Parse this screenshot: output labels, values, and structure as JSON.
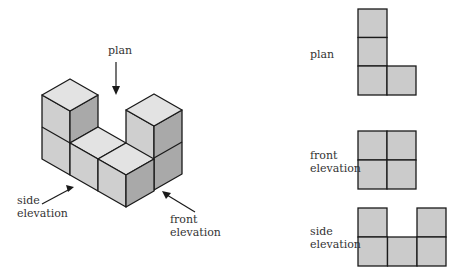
{
  "colors": {
    "top_face": "#e3e3e3",
    "left_face": "#cfcfcf",
    "right_face": "#a9a9a9",
    "square_fill": "#cbcbcb",
    "stroke": "#1a1a1a"
  },
  "isometric": {
    "labels": {
      "plan": "plan",
      "side_line1": "side",
      "side_line2": "elevation",
      "front_line1": "front",
      "front_line2": "elevation"
    }
  },
  "views": {
    "plan": {
      "label": "plan",
      "grid": "L-shape: 3 squares tall in left column, 1 square right at bottom"
    },
    "front": {
      "label_line1": "front",
      "label_line2": "elevation",
      "grid": "2x2 squares"
    },
    "side": {
      "label_line1": "side",
      "label_line2": "elevation",
      "grid": "3 wide bottom row, 2 raised end squares"
    }
  }
}
